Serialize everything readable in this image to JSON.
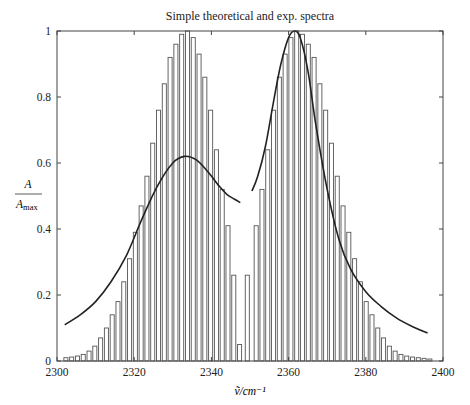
{
  "chart_data": {
    "type": "bar",
    "title": "Simple theoretical and exp. spectra",
    "xlabel": "ṽ/cm⁻¹",
    "ylabel_num": "A",
    "ylabel_den": "A",
    "ylabel_den_sub": "max",
    "xlim": [
      2300,
      2400
    ],
    "ylim": [
      0,
      1
    ],
    "grid": false,
    "x_ticks": [
      2300,
      2320,
      2340,
      2360,
      2380,
      2400
    ],
    "y_ticks": [
      0,
      0.2,
      0.4,
      0.6,
      0.8,
      1
    ],
    "y_tick_labels": [
      "0",
      "0.2",
      "0.4",
      "0.6",
      "0.8",
      "1"
    ],
    "series": [
      {
        "name": "theoretical stick spectrum (bars)",
        "kind": "bar",
        "bar_width": 1.05,
        "x": [
          2302.3,
          2303.8,
          2305.3,
          2306.8,
          2308.3,
          2309.8,
          2311.3,
          2312.8,
          2314.3,
          2315.8,
          2317.3,
          2318.8,
          2320.3,
          2321.8,
          2323.3,
          2324.8,
          2326.3,
          2327.8,
          2329.3,
          2330.8,
          2332.3,
          2333.8,
          2335.3,
          2336.8,
          2338.3,
          2339.8,
          2341.3,
          2342.8,
          2344.3,
          2345.8,
          2347.3,
          2349.3,
          2351.6,
          2353.1,
          2354.6,
          2356.1,
          2357.6,
          2359.1,
          2360.6,
          2362.1,
          2363.6,
          2365.1,
          2366.6,
          2368.1,
          2369.6,
          2371.1,
          2372.6,
          2374.1,
          2375.6,
          2377.1,
          2378.6,
          2380.1,
          2381.6,
          2383.1,
          2384.6,
          2386.1,
          2387.6,
          2389.1,
          2390.6,
          2392.1,
          2393.6,
          2395.1,
          2396.6
        ],
        "values": [
          0.01,
          0.012,
          0.015,
          0.02,
          0.03,
          0.045,
          0.07,
          0.1,
          0.14,
          0.18,
          0.24,
          0.31,
          0.39,
          0.47,
          0.56,
          0.66,
          0.76,
          0.84,
          0.92,
          0.96,
          0.99,
          1.0,
          0.98,
          0.93,
          0.86,
          0.76,
          0.64,
          0.52,
          0.41,
          0.26,
          0.05,
          0.26,
          0.41,
          0.52,
          0.64,
          0.76,
          0.86,
          0.93,
          0.98,
          1.0,
          0.99,
          0.96,
          0.92,
          0.84,
          0.76,
          0.66,
          0.56,
          0.47,
          0.39,
          0.31,
          0.24,
          0.18,
          0.14,
          0.1,
          0.07,
          0.045,
          0.03,
          0.02,
          0.015,
          0.012,
          0.01,
          0.008,
          0.006
        ]
      },
      {
        "name": "experimental spectrum (line)",
        "kind": "line",
        "segments": [
          {
            "x": [
              2302,
              2306,
              2310,
              2314,
              2318,
              2322,
              2326,
              2330,
              2333,
              2336,
              2339,
              2342,
              2344,
              2346,
              2347.5
            ],
            "y": [
              0.11,
              0.14,
              0.18,
              0.24,
              0.32,
              0.43,
              0.53,
              0.6,
              0.62,
              0.61,
              0.575,
              0.53,
              0.505,
              0.49,
              0.48
            ]
          },
          {
            "x": [
              2350.5,
              2352,
              2354,
              2356,
              2358,
              2360,
              2361.5,
              2363,
              2365,
              2367,
              2370,
              2373,
              2376,
              2380,
              2384,
              2388,
              2392,
              2396
            ],
            "y": [
              0.515,
              0.56,
              0.65,
              0.78,
              0.9,
              0.98,
              1.0,
              0.98,
              0.88,
              0.72,
              0.52,
              0.37,
              0.28,
              0.21,
              0.165,
              0.13,
              0.105,
              0.085
            ]
          }
        ]
      }
    ],
    "plot_area_px": {
      "left": 57,
      "right": 443,
      "top": 31,
      "bottom": 361
    }
  }
}
